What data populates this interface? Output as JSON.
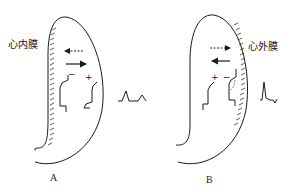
{
  "panels": [
    {
      "id": "A",
      "caption": "A",
      "layer_label": "心内膜",
      "signs": {
        "left": "−",
        "right": "+"
      },
      "arrows": {
        "dashed_direction": "left",
        "solid_direction": "right"
      },
      "ecg_description": "upright wave followed by upright wave"
    },
    {
      "id": "B",
      "caption": "B",
      "layer_label": "心外膜",
      "signs": {
        "left": "+",
        "right": "−"
      },
      "arrows": {
        "dashed_direction": "right",
        "solid_direction": "left"
      },
      "ecg_description": "upright wave followed by inverted wave"
    }
  ],
  "colors": {
    "line": "#1a1a1a",
    "background": "#ffffff"
  }
}
